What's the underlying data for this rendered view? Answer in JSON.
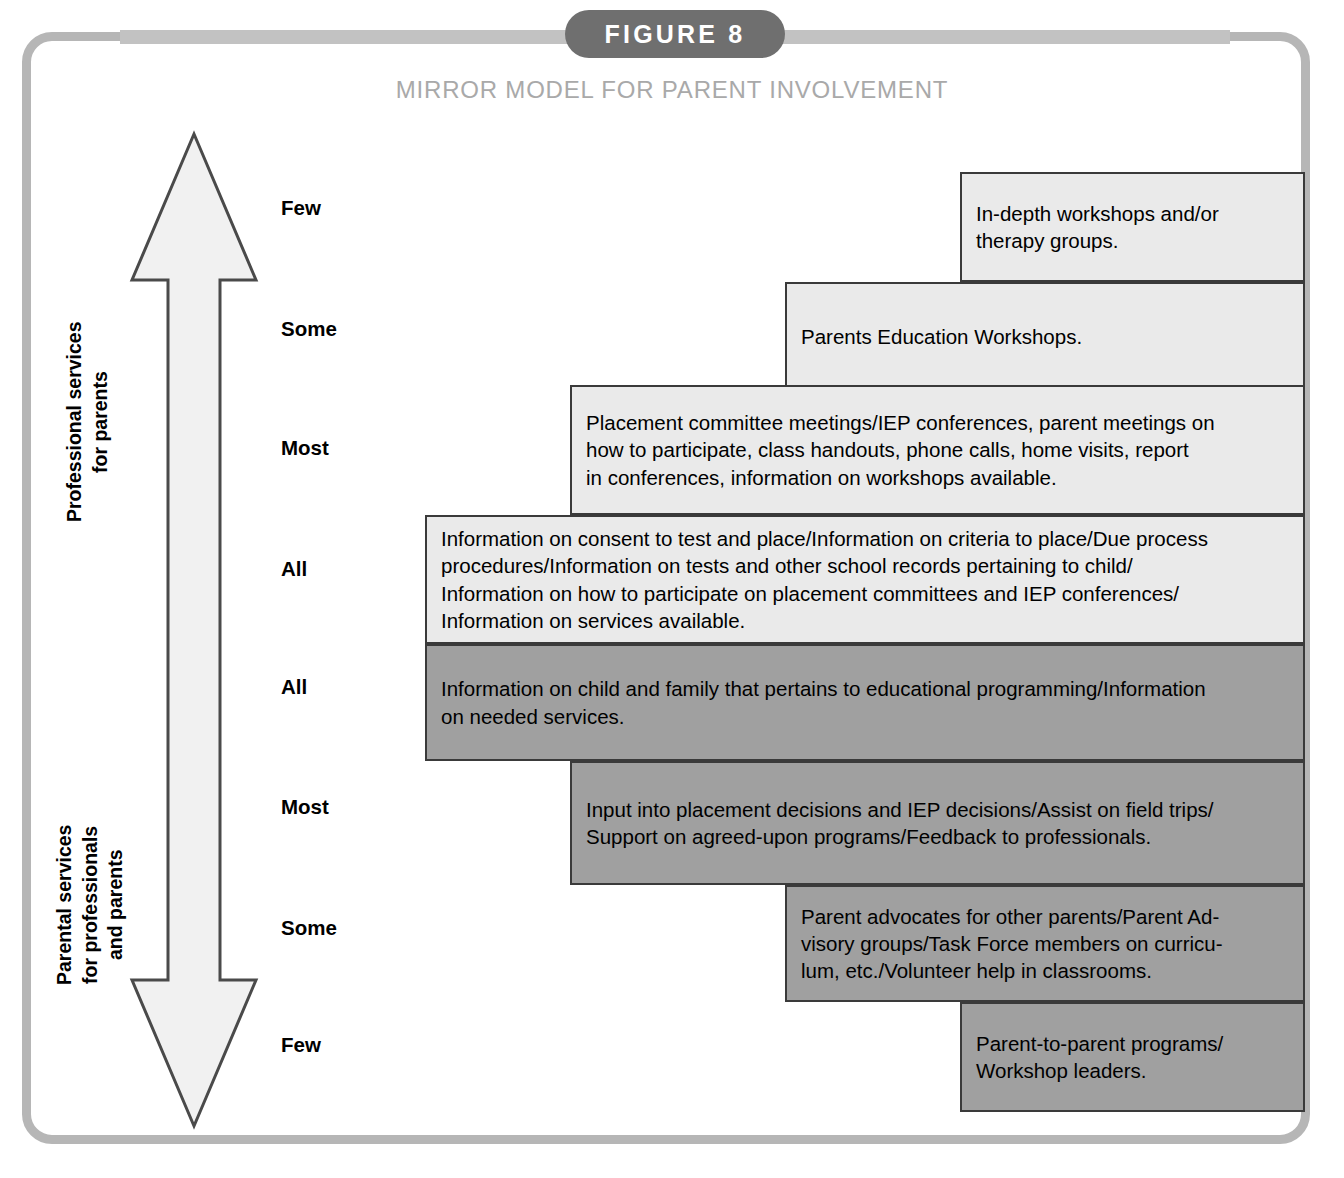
{
  "figure": {
    "badge_label": "FIGURE 8",
    "title": "MIRROR MODEL FOR PARENT INVOLVEMENT",
    "colors": {
      "frame": "#b6b6b6",
      "badge": "#6f6f6f",
      "ribbon": "#c2c2c2",
      "title_text": "#a9a9a9",
      "block_light": "#eaeaea",
      "block_dark": "#a0a0a0",
      "block_border": "#3a3a3a"
    }
  },
  "axis": {
    "arrow_name": "double-headed-vertical-arrow",
    "upper_label": "Professional services\nfor parents",
    "lower_label": "Parental services\nfor professionals\nand parents"
  },
  "tiers": [
    {
      "label": "Few",
      "top": 196
    },
    {
      "label": "Some",
      "top": 317
    },
    {
      "label": "Most",
      "top": 436
    },
    {
      "label": "All",
      "top": 557
    },
    {
      "label": "All",
      "top": 675
    },
    {
      "label": "Most",
      "top": 795
    },
    {
      "label": "Some",
      "top": 916
    },
    {
      "label": "Few",
      "top": 1033
    }
  ],
  "chart_data": {
    "type": "diagram",
    "title": "MIRROR MODEL FOR PARENT INVOLVEMENT",
    "levels": [
      "Few",
      "Some",
      "Most",
      "All",
      "All",
      "Most",
      "Some",
      "Few"
    ],
    "halves": [
      "Professional services for parents",
      "Parental services for professionals and parents"
    ],
    "blocks": [
      {
        "tier": "Few",
        "half": "professional",
        "tone": "light",
        "text": "In-depth workshops and/or\ntherapy groups.",
        "left": 960,
        "top": 172,
        "width": 345,
        "height": 110
      },
      {
        "tier": "Some",
        "half": "professional",
        "tone": "light",
        "text": "Parents Education Workshops.",
        "left": 785,
        "top": 282,
        "width": 520,
        "height": 110
      },
      {
        "tier": "Most",
        "half": "professional",
        "tone": "light",
        "text": "Placement committee meetings/IEP conferences, parent meetings on\nhow to participate, class handouts, phone calls, home visits, report\nin conferences, information on workshops available.",
        "left": 570,
        "top": 385,
        "width": 735,
        "height": 130
      },
      {
        "tier": "All",
        "half": "professional",
        "tone": "light",
        "text": "Information on consent to test and place/Information on criteria to place/Due process\nprocedures/Information on tests and other school records pertaining to child/\nInformation on how to participate on placement committees and IEP conferences/\nInformation on services available.",
        "left": 425,
        "top": 515,
        "width": 880,
        "height": 129
      },
      {
        "tier": "All",
        "half": "parental",
        "tone": "dark",
        "text": "Information on child and family that pertains to educational programming/Information\non needed services.",
        "left": 425,
        "top": 644,
        "width": 880,
        "height": 117
      },
      {
        "tier": "Most",
        "half": "parental",
        "tone": "dark",
        "text": "Input into placement decisions and IEP decisions/Assist on field trips/\nSupport on agreed-upon programs/Feedback to professionals.",
        "left": 570,
        "top": 761,
        "width": 735,
        "height": 124
      },
      {
        "tier": "Some",
        "half": "parental",
        "tone": "dark",
        "text": "Parent advocates for other parents/Parent Ad-\nvisory groups/Task Force members on curricu-\nlum, etc./Volunteer help in classrooms.",
        "left": 785,
        "top": 885,
        "width": 520,
        "height": 117
      },
      {
        "tier": "Few",
        "half": "parental",
        "tone": "dark",
        "text": "Parent-to-parent programs/\nWorkshop leaders.",
        "left": 960,
        "top": 1002,
        "width": 345,
        "height": 110
      }
    ]
  }
}
